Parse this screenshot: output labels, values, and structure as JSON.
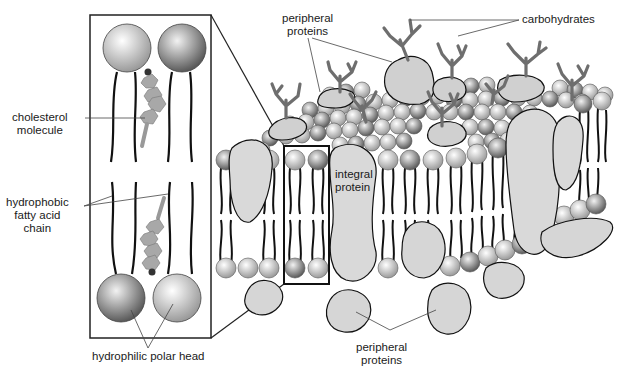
{
  "diagram": {
    "type": "cell membrane (fluid mosaic model)",
    "inset_title": "phospholipid bilayer detail",
    "labels": {
      "cholesterol_line1": "cholesterol",
      "cholesterol_line2": "molecule",
      "fatty_acid_line1": "hydrophobic",
      "fatty_acid_line2": "fatty acid",
      "fatty_acid_line3": "chain",
      "polar_head": "hydrophilic polar head",
      "peripheral_top_line1": "peripheral",
      "peripheral_top_line2": "proteins",
      "carbohydrates": "carbohydrates",
      "integral_line1": "integral",
      "integral_line2": "protein",
      "peripheral_bottom_line1": "peripheral",
      "peripheral_bottom_line2": "proteins"
    },
    "colors": {
      "protein_fill": "#d9d9d9",
      "carbohydrate": "#6e6e6e",
      "head_light": "#e6e6e6",
      "head_dark": "#8a8a8a",
      "outline": "#111111"
    }
  }
}
